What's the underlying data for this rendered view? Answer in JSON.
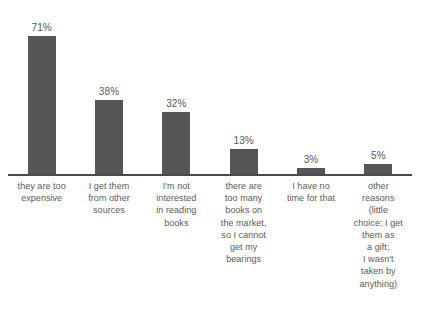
{
  "chart_data": {
    "type": "bar",
    "title": "",
    "subtitle": "",
    "xlabel": "",
    "ylabel": "",
    "ylim": [
      0,
      80
    ],
    "grid": false,
    "legend": false,
    "bar_color": "#555555",
    "label_color": "#5a5a5a",
    "axis_color": "#4a4a4a",
    "background": "#ffffff",
    "categories": [
      "they are too\nexpensive",
      "I get them\nfrom other\nsources",
      "I'm not\ninterested\nin reading\nbooks",
      "there are\ntoo many\nbooks on\nthe market,\nso I cannot\nget my\nbearings",
      "I have no\ntime for that",
      "other\nreasons\n(little\nchoice; I get\nthem as\na gift;\nI wasn't\ntaken by\nanything)"
    ],
    "values": [
      71,
      38,
      32,
      13,
      3,
      5
    ],
    "value_labels": [
      "71%",
      "38%",
      "32%",
      "13%",
      "3%",
      "5%"
    ]
  }
}
